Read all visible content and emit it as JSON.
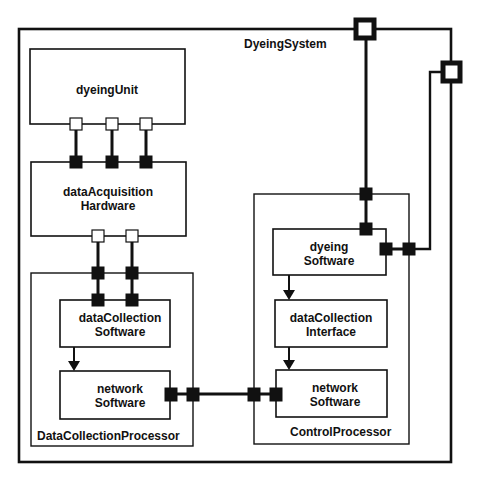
{
  "diagram": {
    "title": "DyeingSystem",
    "colors": {
      "stroke": "#111111",
      "background": "#ffffff"
    },
    "system": {
      "label": "DyeingSystem",
      "x": 19,
      "y": 29,
      "w": 432,
      "h": 433
    },
    "external_ports": [
      {
        "id": "ext-port-1",
        "x": 353,
        "y": 18,
        "size": 22
      },
      {
        "id": "ext-port-2",
        "x": 440,
        "y": 61,
        "size": 22
      }
    ],
    "components": [
      {
        "id": "dyeingUnit",
        "lines": [
          "dyeingUnit"
        ],
        "x": 30,
        "y": 49,
        "w": 155,
        "h": 75
      },
      {
        "id": "dataAcquisitionHardware",
        "lines": [
          "dataAcquisition",
          "Hardware"
        ],
        "x": 31,
        "y": 162,
        "w": 155,
        "h": 74
      },
      {
        "id": "dataCollectionSoftware",
        "lines": [
          "dataCollection",
          "Software"
        ],
        "x": 60,
        "y": 300,
        "w": 110,
        "h": 47
      },
      {
        "id": "networkSoftwareLeft",
        "lines": [
          "network",
          "Software"
        ],
        "x": 60,
        "y": 371,
        "w": 110,
        "h": 48
      },
      {
        "id": "dyeingSoftware",
        "lines": [
          "dyeing",
          "Software"
        ],
        "x": 273,
        "y": 229,
        "w": 113,
        "h": 46
      },
      {
        "id": "dataCollectionInterface",
        "lines": [
          "dataCollection",
          "Interface"
        ],
        "x": 275,
        "y": 300,
        "w": 112,
        "h": 47
      },
      {
        "id": "networkSoftwareRight",
        "lines": [
          "network",
          "Software"
        ],
        "x": 276,
        "y": 370,
        "w": 111,
        "h": 47
      }
    ],
    "processors": [
      {
        "id": "DataCollectionProcessor",
        "label": "DataCollectionProcessor",
        "x": 31,
        "y": 273,
        "w": 162,
        "h": 173
      },
      {
        "id": "ControlProcessor",
        "label": "ControlProcessor",
        "x": 254,
        "y": 194,
        "w": 155,
        "h": 250
      }
    ],
    "labels": {
      "system": "DyeingSystem",
      "dyeingUnit": [
        "dyeingUnit"
      ],
      "dataAcquisitionHardware": [
        "dataAcquisition",
        "Hardware"
      ],
      "dataCollectionSoftware": [
        "dataCollection",
        "Software"
      ],
      "networkSoftwareLeft": [
        "network",
        "Software"
      ],
      "dyeingSoftware": [
        "dyeing",
        "Software"
      ],
      "dataCollectionInterface": [
        "dataCollection",
        "Interface"
      ],
      "networkSoftwareRight": [
        "network",
        "Software"
      ],
      "dataCollectionProcessor": "DataCollectionProcessor",
      "controlProcessor": "ControlProcessor"
    },
    "connections": [
      {
        "from": "dyeingUnit",
        "to": "dataAcquisitionHardware",
        "count": 3
      },
      {
        "from": "dataAcquisitionHardware",
        "to": "dataCollectionSoftware",
        "count": 2
      },
      {
        "from": "dataCollectionSoftware",
        "to": "networkSoftwareLeft",
        "type": "arrow"
      },
      {
        "from": "networkSoftwareLeft",
        "to": "networkSoftwareRight",
        "count": 1
      },
      {
        "from": "ext-port-1",
        "to": "dyeingSoftware",
        "count": 1
      },
      {
        "from": "ext-port-2",
        "to": "dyeingSoftware",
        "count": 1
      },
      {
        "from": "dyeingSoftware",
        "to": "dataCollectionInterface",
        "type": "arrow"
      },
      {
        "from": "dataCollectionInterface",
        "to": "networkSoftwareRight",
        "type": "arrow"
      }
    ]
  }
}
